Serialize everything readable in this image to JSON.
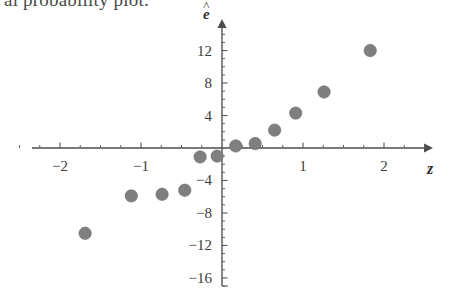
{
  "caption": {
    "text": "al probability plot."
  },
  "chart_data": {
    "type": "scatter",
    "title": "",
    "xlabel": "z",
    "ylabel": "e-hat",
    "ylabel_glyph": "e",
    "ylabel_accent": "^",
    "xlim": [
      -2.75,
      2.55
    ],
    "ylim": [
      -17.0,
      14.8
    ],
    "grid": false,
    "legend": null,
    "x_ticks": [
      -2,
      -1,
      1,
      2
    ],
    "x_tick_labels": [
      "−2",
      "−1",
      "1",
      "2"
    ],
    "x_minor_step": 0.25,
    "y_ticks": [
      12,
      8,
      4,
      -4,
      -8,
      -12,
      -16
    ],
    "y_tick_labels": [
      "12",
      "8",
      "4",
      "−4",
      "−8",
      "−12",
      "−16"
    ],
    "y_minor_step": 1,
    "points": [
      {
        "z": -1.69,
        "e": -10.5
      },
      {
        "z": -1.12,
        "e": -5.9
      },
      {
        "z": -0.74,
        "e": -5.7
      },
      {
        "z": -0.46,
        "e": -5.2
      },
      {
        "z": -0.27,
        "e": -1.1
      },
      {
        "z": -0.06,
        "e": -1.0
      },
      {
        "z": 0.17,
        "e": 0.25
      },
      {
        "z": 0.41,
        "e": 0.55
      },
      {
        "z": 0.65,
        "e": 2.2
      },
      {
        "z": 0.91,
        "e": 4.3
      },
      {
        "z": 1.26,
        "e": 6.9
      },
      {
        "z": 1.83,
        "e": 12.0
      }
    ],
    "marker": {
      "shape": "circle",
      "radius_px": 6.2,
      "color": "#7f7f7f",
      "edge_color": "#6c6c6c"
    },
    "axis_color": "#4d4d4d",
    "background": "#ffffff"
  },
  "geometry": {
    "origin_x": 222,
    "origin_y": 148,
    "px_per_x_unit": 81,
    "px_per_y_unit": 8.12,
    "x_axis_left": 32,
    "x_axis_right": 424,
    "y_axis_top": 28,
    "y_axis_bottom": 286
  }
}
